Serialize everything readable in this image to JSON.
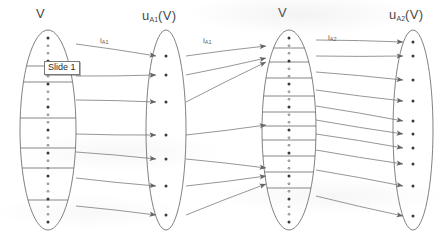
{
  "figure": {
    "type": "set-mapping-diagram",
    "stroke_color": "#6b6b6b",
    "text_color": "#4a4a4a",
    "background": "#ffffff"
  },
  "overlay": {
    "tooltip_label": "Slide 1",
    "tooltip_border": "#7a7a7a",
    "tooltip_background": "#ffffff"
  },
  "sets": [
    {
      "id": "set-v-left",
      "label_main": "V",
      "label_sub": "",
      "cx": 48,
      "cy": 130,
      "rx": 28,
      "ry": 100,
      "dot_count": 25,
      "divider_count": 6,
      "divider_ys": [
        66,
        82,
        118,
        148,
        168,
        200
      ],
      "has_arrowheads": false
    },
    {
      "id": "set-ua1-v",
      "label_main": "u",
      "label_sub": "A1",
      "label_suffix": "(V)",
      "cx": 166,
      "cy": 130,
      "rx": 20,
      "ry": 100,
      "dot_count": 7,
      "divider_count": 0,
      "dot_ys": [
        56,
        75,
        102,
        135,
        159,
        186,
        215
      ],
      "has_arrowheads": true
    },
    {
      "id": "set-v-right",
      "label_main": "V",
      "label_sub": "",
      "cx": 289,
      "cy": 130,
      "rx": 27,
      "ry": 100,
      "dot_count": 25,
      "divider_count": 10,
      "divider_ys": [
        48,
        62,
        78,
        96,
        112,
        126,
        140,
        156,
        172,
        188
      ],
      "has_arrowheads": true
    },
    {
      "id": "set-ua2-v",
      "label_main": "u",
      "label_sub": "A2",
      "label_suffix": "(V)",
      "cx": 413,
      "cy": 130,
      "rx": 20,
      "ry": 100,
      "dot_count": 10,
      "divider_count": 0,
      "dot_ys": [
        42,
        56,
        80,
        101,
        121,
        134,
        148,
        164,
        186,
        216
      ],
      "has_arrowheads": true
    }
  ],
  "maps": [
    {
      "id": "map-1",
      "label_main": "i",
      "label_sub": "A1",
      "x": 100,
      "y": 36
    },
    {
      "id": "map-2",
      "label_main": "i",
      "label_sub": "A1",
      "x": 203,
      "y": 36
    },
    {
      "id": "map-3",
      "label_main": "i",
      "label_sub": "A2",
      "x": 328,
      "y": 33
    }
  ],
  "arrows": {
    "group_1": [
      {
        "from": [
          76,
          44
        ],
        "to": [
          156,
          56
        ]
      },
      {
        "from": [
          76,
          76
        ],
        "to": [
          156,
          75
        ]
      },
      {
        "from": [
          76,
          100
        ],
        "to": [
          156,
          102
        ]
      },
      {
        "from": [
          76,
          134
        ],
        "to": [
          156,
          135
        ]
      },
      {
        "from": [
          76,
          152
        ],
        "to": [
          156,
          159
        ]
      },
      {
        "from": [
          76,
          178
        ],
        "to": [
          156,
          186
        ]
      },
      {
        "from": [
          76,
          206
        ],
        "to": [
          156,
          215
        ]
      }
    ],
    "group_2": [
      {
        "from": [
          186,
          56
        ],
        "to": [
          266,
          46
        ]
      },
      {
        "from": [
          186,
          75
        ],
        "to": [
          266,
          58
        ]
      },
      {
        "from": [
          186,
          102
        ],
        "to": [
          266,
          62
        ]
      },
      {
        "from": [
          186,
          135
        ],
        "to": [
          266,
          125
        ]
      },
      {
        "from": [
          186,
          159
        ],
        "to": [
          266,
          168
        ]
      },
      {
        "from": [
          186,
          186
        ],
        "to": [
          266,
          176
        ]
      },
      {
        "from": [
          186,
          215
        ],
        "to": [
          266,
          184
        ]
      }
    ],
    "group_3": [
      {
        "from": [
          316,
          40
        ],
        "to": [
          403,
          42
        ]
      },
      {
        "from": [
          316,
          56
        ],
        "to": [
          403,
          56
        ]
      },
      {
        "from": [
          316,
          72
        ],
        "to": [
          403,
          80
        ]
      },
      {
        "from": [
          316,
          90
        ],
        "to": [
          403,
          101
        ]
      },
      {
        "from": [
          316,
          106
        ],
        "to": [
          403,
          121
        ]
      },
      {
        "from": [
          316,
          120
        ],
        "to": [
          403,
          134
        ]
      },
      {
        "from": [
          316,
          134
        ],
        "to": [
          403,
          148
        ]
      },
      {
        "from": [
          316,
          150
        ],
        "to": [
          403,
          164
        ]
      },
      {
        "from": [
          316,
          170
        ],
        "to": [
          403,
          186
        ]
      },
      {
        "from": [
          316,
          196
        ],
        "to": [
          403,
          216
        ]
      }
    ]
  }
}
